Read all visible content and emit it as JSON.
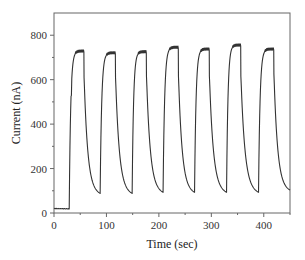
{
  "chart_data": {
    "type": "line",
    "title": "",
    "xlabel": "Time (sec)",
    "ylabel": "Current (nA)",
    "xlim": [
      0,
      450
    ],
    "ylim": [
      0,
      900
    ],
    "x_ticks": [
      0,
      100,
      200,
      300,
      400
    ],
    "x_minor_ticks": [
      50,
      150,
      250,
      350,
      450
    ],
    "y_ticks": [
      0,
      200,
      400,
      600,
      800
    ],
    "y_minor_ticks": [
      100,
      300,
      500,
      700
    ],
    "grid": false,
    "legend": null,
    "line_color": "#333333",
    "series": [
      {
        "name": "Current response",
        "pulses": [
          {
            "on": 29,
            "off": 57,
            "peak": 728,
            "min_after": 90
          },
          {
            "on": 88,
            "off": 117,
            "peak": 720,
            "min_after": 90
          },
          {
            "on": 149,
            "off": 176,
            "peak": 725,
            "min_after": 95
          },
          {
            "on": 208,
            "off": 237,
            "peak": 745,
            "min_after": 95
          },
          {
            "on": 268,
            "off": 296,
            "peak": 737,
            "min_after": 95
          },
          {
            "on": 329,
            "off": 356,
            "peak": 755,
            "min_after": 95
          },
          {
            "on": 390,
            "off": 419,
            "peak": 737,
            "min_after": 105
          }
        ],
        "baseline": 20,
        "baseline_end": 29,
        "x_end": 450
      }
    ]
  },
  "labels": {
    "xlabel": "Time (sec)",
    "ylabel": "Current (nA)",
    "x_tick_labels": [
      "0",
      "100",
      "200",
      "300",
      "400"
    ],
    "y_tick_labels": [
      "0",
      "200",
      "400",
      "600",
      "800"
    ]
  }
}
